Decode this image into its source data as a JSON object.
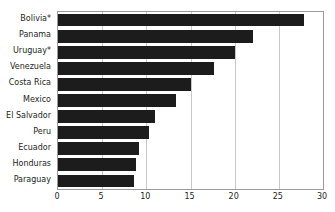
{
  "chart_data": {
    "type": "bar",
    "orientation": "horizontal",
    "title": "",
    "xlabel": "",
    "ylabel": "",
    "xlim": [
      0,
      30
    ],
    "xticks": [
      0,
      5,
      10,
      15,
      20,
      25,
      30
    ],
    "grid": true,
    "legend": null,
    "categories": [
      "Bolivia*",
      "Panama",
      "Uruguay*",
      "Venezuela",
      "Costa Rica",
      "Mexico",
      "El Salvador",
      "Peru",
      "Ecuador",
      "Honduras",
      "Paraguay"
    ],
    "values": [
      27.8,
      22.1,
      20.0,
      17.7,
      15.1,
      13.4,
      11.0,
      10.3,
      9.2,
      8.8,
      8.6
    ],
    "bar_color": "#1c1c1c",
    "grid_color": "#c9c9c9",
    "frame_color": "#9a9a9a",
    "text_color": "#231f20"
  }
}
